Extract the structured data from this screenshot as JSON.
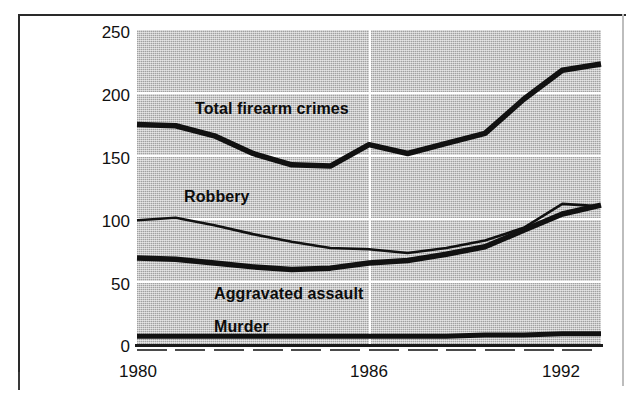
{
  "figure": {
    "background_color": "#ffffff",
    "plot_fill_color": "#c8c8c8",
    "line_color": "#111111",
    "grid_color": "#ffffff",
    "frame_color": "#2a2a2a"
  },
  "axis": {
    "y_ticks": [
      "250",
      "200",
      "150",
      "100",
      "50",
      "0"
    ],
    "x_ticks": [
      "1980",
      "1986",
      "1992"
    ]
  },
  "series_labels": {
    "total": "Total firearm crimes",
    "robbery": "Robbery",
    "aggravated_assault": "Aggravated assault",
    "murder": "Murder"
  },
  "chart_data": {
    "type": "line",
    "title": "",
    "subtitle": "",
    "xlabel": "",
    "ylabel": "",
    "xlim": [
      1980,
      1992
    ],
    "ylim": [
      0,
      250
    ],
    "ytick_values": [
      0,
      50,
      100,
      150,
      200,
      250
    ],
    "xtick_values": [
      1980,
      1986,
      1992
    ],
    "grid": "horizontal gridlines at every 50 units, white; one white vertical gridline at 1986",
    "legend": "inline labels placed directly on plot area",
    "x": [
      1980,
      1981,
      1982,
      1983,
      1984,
      1985,
      1986,
      1987,
      1988,
      1989,
      1990,
      1991,
      1992
    ],
    "series": [
      {
        "name": "Total firearm crimes",
        "label_position": {
          "x": 1981.6,
          "y": 188
        },
        "line_width": "thick",
        "values": [
          175,
          174,
          166,
          152,
          143,
          142,
          159,
          152,
          160,
          168,
          195,
          218,
          223
        ]
      },
      {
        "name": "Robbery",
        "label_position": {
          "x": 1981.3,
          "y": 118
        },
        "line_width": "thin",
        "values": [
          99,
          101,
          95,
          88,
          82,
          77,
          76,
          73,
          77,
          83,
          93,
          112,
          110
        ]
      },
      {
        "name": "Aggravated assault",
        "label_position": {
          "x": 1982.1,
          "y": 41
        },
        "line_width": "thick",
        "values": [
          69,
          68,
          65,
          62,
          60,
          61,
          65,
          67,
          72,
          78,
          91,
          104,
          111
        ]
      },
      {
        "name": "Murder",
        "label_position": {
          "x": 1982.1,
          "y": 22
        },
        "line_width": "thick",
        "values": [
          7,
          7,
          7,
          7,
          7,
          7,
          7,
          7,
          7,
          8,
          8,
          9,
          9
        ]
      }
    ]
  }
}
